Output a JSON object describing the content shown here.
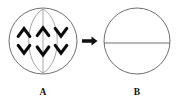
{
  "figure": {
    "width": 178,
    "height": 105,
    "background_color": "#ffffff"
  },
  "colors": {
    "outline": "#555555",
    "spindle": "#888888",
    "chromosome": "#0a0a0a",
    "arrow": "#111111",
    "label": "#111111"
  },
  "panels": [
    {
      "id": "panel-a",
      "label": "A",
      "label_position": {
        "x": 43,
        "y": 94
      },
      "cell": {
        "cx": 43,
        "cy": 41,
        "rx": 34,
        "ry": 33
      },
      "spindle": {
        "type": "vesica",
        "description": "inner lens shaped spindle formed by two opposing arcs",
        "left_arc": "M 43 9 C 24 20, 24 62, 43 73",
        "right_arc": "M 43 9 C 62 20, 62 62, 43 73"
      },
      "center_axis": {
        "orientation": "vertical",
        "x1": 43,
        "y1": 9,
        "x2": 43,
        "y2": 73
      },
      "chromosomes": {
        "count": 6,
        "top_row_label": "three chevrons opening downward (apex up)",
        "bottom_row_label": "three chevrons opening upward (apex down)",
        "top_row": [
          {
            "x": 24,
            "y": 31,
            "direction": "up"
          },
          {
            "x": 43,
            "y": 30,
            "direction": "up"
          },
          {
            "x": 61,
            "y": 31,
            "direction": "up"
          }
        ],
        "bottom_row": [
          {
            "x": 24,
            "y": 50,
            "direction": "down"
          },
          {
            "x": 43,
            "y": 52,
            "direction": "down"
          },
          {
            "x": 61,
            "y": 50,
            "direction": "down"
          }
        ]
      }
    },
    {
      "id": "panel-b",
      "label": "B",
      "label_position": {
        "x": 137,
        "y": 94
      },
      "cell": {
        "cx": 137,
        "cy": 41,
        "rx": 33,
        "ry": 33
      },
      "cell_plate": {
        "orientation": "horizontal",
        "x1": 104,
        "y1": 43,
        "x2": 170,
        "y2": 43,
        "description": "horizontal cell plate dividing the circle"
      }
    }
  ],
  "arrow": {
    "direction": "right",
    "x1": 82,
    "x2": 97,
    "y": 41,
    "shaft_thickness": 3.4,
    "head_width": 7,
    "head_height": 9
  }
}
